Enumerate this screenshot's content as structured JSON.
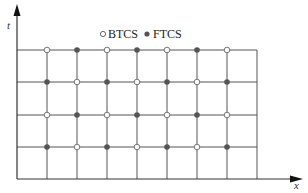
{
  "diagram": {
    "type": "finite-difference-stencil-grid",
    "axes": {
      "x_label": "x",
      "y_label": "t"
    },
    "legend": [
      {
        "marker": "open-circle",
        "label": "BTCS"
      },
      {
        "marker": "filled-circle",
        "label": "FTCS"
      }
    ],
    "grid": {
      "columns_x": [
        17,
        47,
        77,
        107,
        137,
        167,
        197,
        227,
        257
      ],
      "rows_y": [
        179,
        147,
        115,
        82,
        50
      ],
      "interior_columns": 7,
      "interior_rows": 4
    },
    "nodes": [
      [
        "BTCS",
        "FTCS",
        "BTCS",
        "FTCS",
        "BTCS",
        "FTCS",
        "BTCS"
      ],
      [
        "FTCS",
        "BTCS",
        "FTCS",
        "BTCS",
        "FTCS",
        "BTCS",
        "FTCS"
      ],
      [
        "BTCS",
        "FTCS",
        "BTCS",
        "FTCS",
        "BTCS",
        "FTCS",
        "BTCS"
      ],
      [
        "FTCS",
        "BTCS",
        "FTCS",
        "BTCS",
        "FTCS",
        "BTCS",
        "FTCS"
      ]
    ],
    "colors": {
      "line": "#555555",
      "filled_marker": "#555555",
      "open_marker_stroke": "#666666"
    }
  }
}
